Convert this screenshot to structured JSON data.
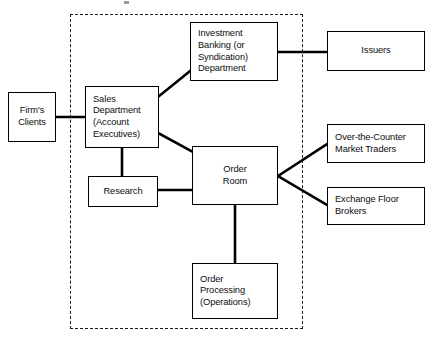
{
  "diagram": {
    "boundary": {
      "name": "firm-boundary",
      "style": "dashed",
      "color": "#1a1a1a"
    },
    "line_color": "#000000",
    "box_border_color": "#000000",
    "background": "#ffffff",
    "nodes": [
      {
        "id": "firms-clients",
        "label": "Firm's\nClients",
        "align": "center",
        "inside_boundary": false
      },
      {
        "id": "sales-department",
        "label": "Sales\nDepartment\n(Account\nExecutives)",
        "align": "left",
        "inside_boundary": true
      },
      {
        "id": "investment-banking",
        "label": "Investment\nBanking  (or\nSyndication)\nDepartment",
        "align": "left",
        "inside_boundary": true
      },
      {
        "id": "issuers",
        "label": "Issuers",
        "align": "center",
        "inside_boundary": false
      },
      {
        "id": "research",
        "label": "Research",
        "align": "center",
        "inside_boundary": true
      },
      {
        "id": "order-room",
        "label": "Order\nRoom",
        "align": "center",
        "inside_boundary": true
      },
      {
        "id": "over-the-counter-market-traders",
        "label": "Over-the-Counter\nMarket Traders",
        "align": "left",
        "inside_boundary": false
      },
      {
        "id": "exchange-floor-brokers",
        "label": "Exchange Floor\nBrokers",
        "align": "left",
        "inside_boundary": false
      },
      {
        "id": "order-processing",
        "label": "Order\nProcessing\n(Operations)",
        "align": "left",
        "inside_boundary": true
      }
    ],
    "connections": [
      {
        "from": "firms-clients",
        "to": "sales-department",
        "kind": "horizontal"
      },
      {
        "from": "sales-department",
        "to": "investment-banking",
        "kind": "diagonal"
      },
      {
        "from": "investment-banking",
        "to": "issuers",
        "kind": "horizontal"
      },
      {
        "from": "sales-department",
        "to": "research",
        "kind": "vertical"
      },
      {
        "from": "sales-department",
        "to": "order-room",
        "kind": "diagonal"
      },
      {
        "from": "research",
        "to": "order-room",
        "kind": "horizontal"
      },
      {
        "from": "order-room",
        "to": "over-the-counter-market-traders",
        "kind": "diagonal"
      },
      {
        "from": "order-room",
        "to": "exchange-floor-brokers",
        "kind": "diagonal"
      },
      {
        "from": "order-room",
        "to": "order-processing",
        "kind": "vertical"
      }
    ]
  }
}
